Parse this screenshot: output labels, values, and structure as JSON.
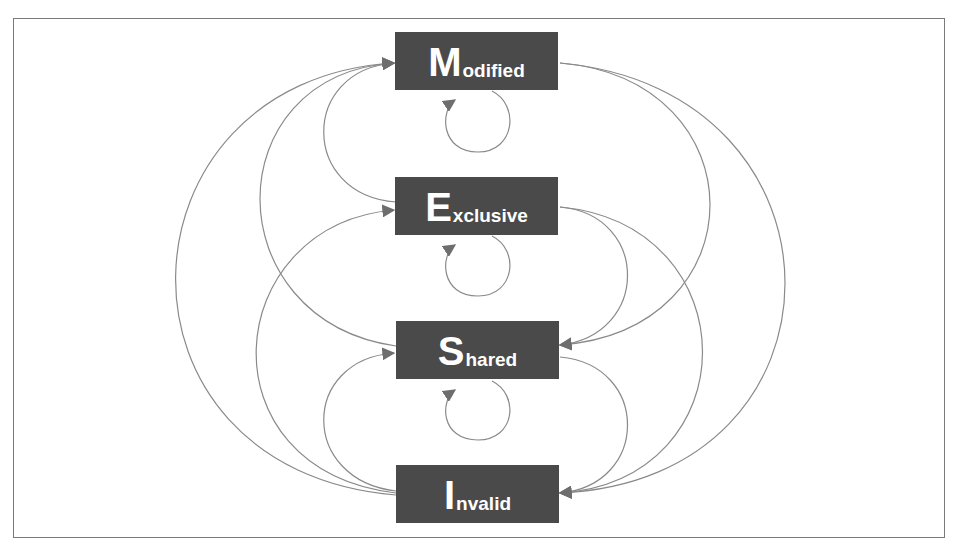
{
  "diagram": {
    "colors": {
      "box_fill": "#4a4a4a",
      "box_text": "#ffffff",
      "edge": "#888888",
      "arrow": "#6e6e6e",
      "frame": "#7a7a7a"
    },
    "states": [
      {
        "id": "M",
        "initial": "M",
        "rest": "odified",
        "label": "Modified"
      },
      {
        "id": "E",
        "initial": "E",
        "rest": "xclusive",
        "label": "Exclusive"
      },
      {
        "id": "S",
        "initial": "S",
        "rest": "hared",
        "label": "Shared"
      },
      {
        "id": "I",
        "initial": "I",
        "rest": "nvalid",
        "label": "Invalid"
      }
    ],
    "transitions": [
      {
        "from": "Modified",
        "to": "Modified"
      },
      {
        "from": "Exclusive",
        "to": "Exclusive"
      },
      {
        "from": "Shared",
        "to": "Shared"
      },
      {
        "from": "Exclusive",
        "to": "Modified"
      },
      {
        "from": "Shared",
        "to": "Modified"
      },
      {
        "from": "Invalid",
        "to": "Modified"
      },
      {
        "from": "Invalid",
        "to": "Exclusive"
      },
      {
        "from": "Invalid",
        "to": "Shared"
      },
      {
        "from": "Modified",
        "to": "Shared"
      },
      {
        "from": "Modified",
        "to": "Invalid"
      },
      {
        "from": "Exclusive",
        "to": "Shared"
      },
      {
        "from": "Exclusive",
        "to": "Invalid"
      },
      {
        "from": "Shared",
        "to": "Invalid"
      }
    ]
  }
}
